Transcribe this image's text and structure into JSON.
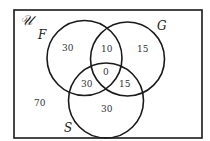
{
  "universe": {
    "label": "𝒰",
    "outside_count": "70"
  },
  "sets": {
    "F": {
      "label": "F"
    },
    "G": {
      "label": "G"
    },
    "S": {
      "label": "S"
    }
  },
  "regions": {
    "F_only": "30",
    "G_only": "15",
    "S_only": "30",
    "F_and_G_only": "10",
    "F_and_S_only": "30",
    "G_and_S_only": "15",
    "F_G_S": "0"
  },
  "colors": {
    "stroke": "#1a1a1a",
    "background": "#ffffff"
  }
}
